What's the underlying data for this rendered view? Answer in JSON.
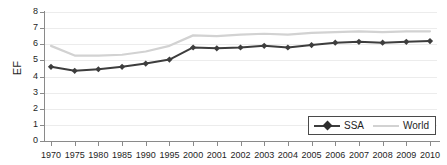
{
  "chart_data": {
    "type": "line",
    "title": "",
    "xlabel": "",
    "ylabel": "EF",
    "ylim": [
      0,
      8
    ],
    "ytick_values": [
      0,
      1,
      2,
      3,
      4,
      5,
      6,
      7,
      8
    ],
    "ytick_labels": [
      "0",
      "1",
      "2",
      "3",
      "4",
      "5",
      "6",
      "7",
      "8"
    ],
    "grid": true,
    "grid_axis": "y",
    "legend_position": "lower right",
    "categories": [
      "1970",
      "1975",
      "1980",
      "1985",
      "1990",
      "1995",
      "2000",
      "2001",
      "2002",
      "2003",
      "2004",
      "2005",
      "2006",
      "2007",
      "2008",
      "2009",
      "2010"
    ],
    "series": [
      {
        "name": "SSA",
        "color": "#3d3d3d",
        "marker": "diamond",
        "values": [
          4.6,
          4.35,
          4.45,
          4.6,
          4.8,
          5.05,
          5.8,
          5.75,
          5.8,
          5.9,
          5.8,
          5.95,
          6.1,
          6.15,
          6.1,
          6.15,
          6.2
        ]
      },
      {
        "name": "World",
        "color": "#d2d2d2",
        "marker": "none",
        "values": [
          5.9,
          5.3,
          5.3,
          5.35,
          5.55,
          5.9,
          6.55,
          6.5,
          6.6,
          6.65,
          6.6,
          6.7,
          6.75,
          6.8,
          6.75,
          6.8,
          6.8
        ]
      }
    ]
  },
  "legend": {
    "items": [
      {
        "label": "SSA"
      },
      {
        "label": "World"
      }
    ]
  },
  "axis": {
    "y_title": "EF"
  },
  "colors": {
    "ssa": "#3d3d3d",
    "world": "#d2d2d2",
    "axis": "#8a8a8a",
    "grid": "#ececec",
    "text": "#1e1e1e",
    "legend_border": "#4a4a4a",
    "background": "#ffffff"
  }
}
